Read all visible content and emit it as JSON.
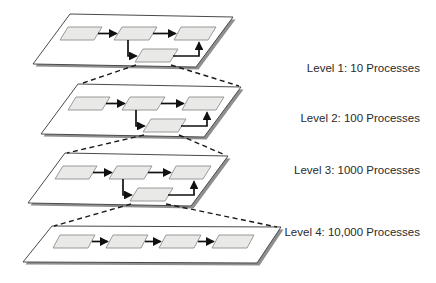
{
  "colors": {
    "background": "#ffffff",
    "plane_fill": "#ffffff",
    "plane_border": "#4a4a4a",
    "plane_shadow": "#8f8f8f",
    "box_fill": "#e9e9e7",
    "box_border": "#8f8f8f",
    "arrow": "#111111",
    "dashed_line": "#1a1a1a",
    "label_text": "#2a2a2a"
  },
  "diagram": {
    "levels": [
      {
        "label": "Level 1: 10 Processes",
        "boxes_shown": 4
      },
      {
        "label": "Level 2: 100 Processes",
        "boxes_shown": 4
      },
      {
        "label": "Level 3: 1000 Processes",
        "boxes_shown": 4
      },
      {
        "label": "Level 4: 10,000 Processes",
        "boxes_shown": 4
      }
    ]
  }
}
